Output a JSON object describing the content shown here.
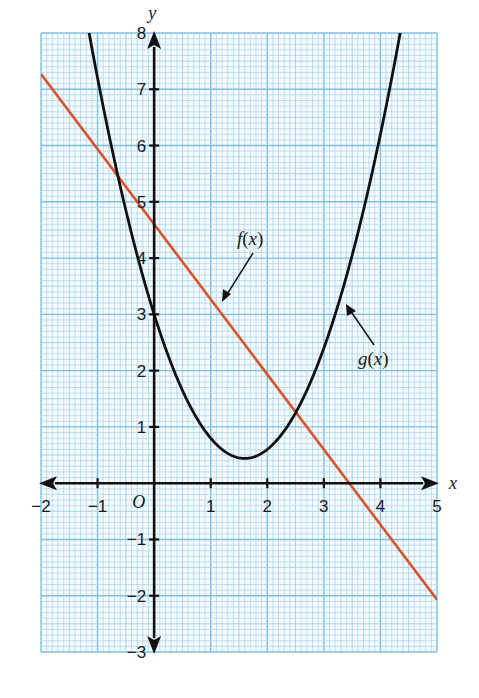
{
  "chart_data": {
    "type": "line",
    "title": "",
    "xlabel": "x",
    "ylabel": "y",
    "origin_label": "O",
    "xlim": [
      -2,
      5
    ],
    "ylim": [
      -3,
      8
    ],
    "grid": true,
    "grid_minor_per_unit": 10,
    "x_ticks": [
      -2,
      -1,
      1,
      2,
      3,
      4,
      5
    ],
    "x_tick_labels": [
      "−2",
      "−1",
      "1",
      "2",
      "3",
      "4",
      "5"
    ],
    "y_ticks": [
      8,
      7,
      6,
      5,
      4,
      3,
      2,
      1,
      -1,
      -2,
      -3
    ],
    "y_tick_labels": [
      "8",
      "7",
      "6",
      "5",
      "4",
      "3",
      "2",
      "1",
      "−1",
      "−2",
      "−3"
    ],
    "series": [
      {
        "name": "f(x)",
        "kind": "linear",
        "color": "#d9532c",
        "points": [
          [
            -2,
            7.27
          ],
          [
            0,
            4.6
          ],
          [
            3.45,
            0
          ],
          [
            5,
            -2.07
          ]
        ]
      },
      {
        "name": "g(x)",
        "kind": "quadratic",
        "color": "#111111",
        "vertex": [
          1.6,
          0.44
        ],
        "points": [
          [
            -1.15,
            8
          ],
          [
            -0.6,
            5.28
          ],
          [
            0,
            3
          ],
          [
            1,
            0.8
          ],
          [
            1.6,
            0.44
          ],
          [
            2.5,
            1.25
          ],
          [
            3.5,
            4.05
          ],
          [
            4.35,
            8
          ]
        ]
      }
    ],
    "intersections": [
      [
        -0.6,
        5.4
      ],
      [
        2.5,
        1.27
      ]
    ],
    "annotations": [
      {
        "text": "f(x)",
        "arrow_to": [
          1.2,
          3.0
        ]
      },
      {
        "text": "g(x)",
        "arrow_to": [
          3.5,
          3.4
        ]
      }
    ]
  },
  "labels": {
    "x_axis": "x",
    "y_axis": "y",
    "origin": "O",
    "f_label": "f(x)",
    "g_label": "g(x)"
  },
  "colors": {
    "grid_minor": "#a9d3ec",
    "grid_major": "#7fbfe3",
    "f_line": "#d9532c",
    "g_curve": "#111111",
    "axes": "#111111"
  }
}
